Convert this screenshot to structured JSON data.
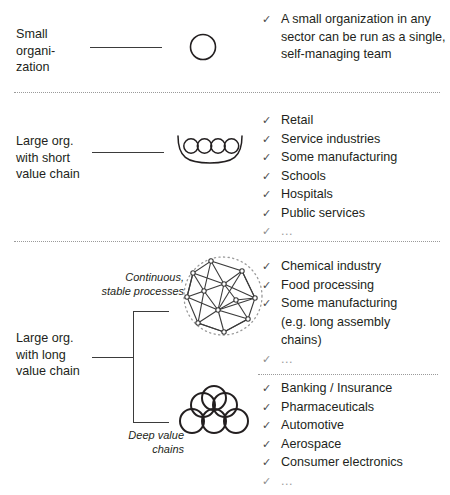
{
  "figure": {
    "ink_color": "#231f20",
    "line_color": "#3b3b3b",
    "divider_color": "#9a9a9a"
  },
  "rows": [
    {
      "id": "small-organization",
      "label": "Small\norgani-\nzation",
      "annotation": "",
      "icon": "single-circle-icon",
      "bullets": [
        {
          "text": "A small organization in any sector can be run as a single, self-managing team",
          "faint": false
        }
      ]
    },
    {
      "id": "large-org-short-value-chain",
      "label": "Large org.\nwith short\nvalue chain",
      "annotation": "",
      "icon": "four-circles-basket-icon",
      "bullets": [
        {
          "text": "Retail",
          "faint": false
        },
        {
          "text": "Service industries",
          "faint": false
        },
        {
          "text": "Some manufacturing",
          "faint": false
        },
        {
          "text": "Schools",
          "faint": false
        },
        {
          "text": "Hospitals",
          "faint": false
        },
        {
          "text": "Public services",
          "faint": false
        },
        {
          "text": "...",
          "faint": true
        }
      ]
    },
    {
      "id": "continuous-stable-processes",
      "label": "Large org.\nwith long\nvalue chain",
      "annotation": "Continuous,\nstable processes",
      "icon": "network-mesh-icon",
      "bullets": [
        {
          "text": "Chemical industry",
          "faint": false
        },
        {
          "text": "Food processing",
          "faint": false
        },
        {
          "text": "Some manufacturing",
          "faint": false
        },
        {
          "text": "(e.g. long assembly",
          "faint": false
        },
        {
          "text": "chains)",
          "faint": false
        },
        {
          "text": "...",
          "faint": true
        }
      ]
    },
    {
      "id": "deep-value-chains",
      "label": "",
      "annotation": "Deep value\nchains",
      "icon": "circle-pyramid-icon",
      "bullets": [
        {
          "text": "Banking / Insurance",
          "faint": false
        },
        {
          "text": "Pharmaceuticals",
          "faint": false
        },
        {
          "text": "Automotive",
          "faint": false
        },
        {
          "text": "Aerospace",
          "faint": false
        },
        {
          "text": "Consumer electronics",
          "faint": false
        },
        {
          "text": "...",
          "faint": true
        }
      ]
    }
  ],
  "symbols": {
    "check": "✓",
    "ellipsis": "..."
  }
}
